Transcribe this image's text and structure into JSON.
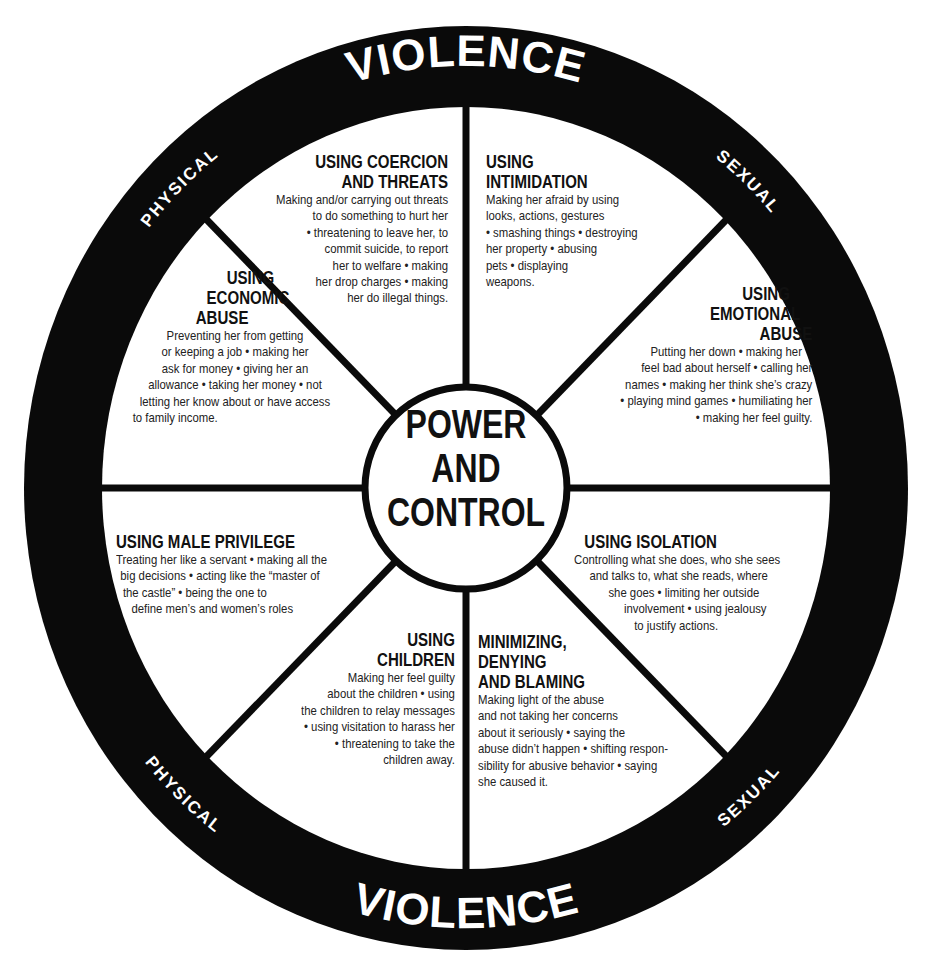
{
  "diagram": {
    "center": {
      "lines": [
        "POWER",
        "AND",
        "CONTROL"
      ]
    },
    "outer_ring": {
      "top": {
        "left": "PHYSICAL",
        "main": "VIOLENCE",
        "right": "SEXUAL"
      },
      "bottom": {
        "left": "PHYSICAL",
        "main": "VIOLENCE",
        "right": "SEXUAL"
      }
    },
    "colors": {
      "ring": "#0a0a0a",
      "background": "#ffffff",
      "text": "#1a1a1a",
      "ring_text": "#ffffff"
    },
    "sections": {
      "coercion": {
        "title": [
          "USING COERCION",
          "AND THREATS"
        ],
        "body": [
          "Making and/or carrying out threats",
          "to do something to hurt her",
          "• threatening to leave her, to",
          "commit suicide, to report",
          "her to welfare • making",
          "her drop charges • making",
          "her do illegal things."
        ]
      },
      "intimidation": {
        "title": [
          "USING",
          "INTIMIDATION"
        ],
        "body": [
          "Making her afraid by using",
          "looks, actions, gestures",
          "• smashing things • destroying",
          "her property • abusing",
          "pets • displaying",
          "weapons."
        ]
      },
      "economic": {
        "title": [
          "USING",
          "ECONOMIC",
          "ABUSE"
        ],
        "body": [
          "Preventing her from getting",
          "or keeping a job • making her",
          "ask for money • giving her an",
          "allowance • taking her money • not",
          "letting her know about or have access",
          "to family income."
        ]
      },
      "emotional": {
        "title": [
          "USING",
          "EMOTIONAL",
          "ABUSE"
        ],
        "body": [
          "Putting her down • making her",
          "feel bad about herself • calling her",
          "names • making her think she’s crazy",
          "• playing mind games • humiliating her",
          "• making her feel guilty."
        ]
      },
      "male_privilege": {
        "title": [
          "USING MALE PRIVILEGE"
        ],
        "body": [
          "Treating her like a servant • making all the",
          "big decisions • acting like the “master of",
          "the castle”  • being the one to",
          "define men’s and women’s roles"
        ]
      },
      "isolation": {
        "title": [
          "USING ISOLATION"
        ],
        "body": [
          "Controlling what she does, who she sees",
          "and talks to, what she reads, where",
          "she goes • limiting her outside",
          "involvement • using jealousy",
          "to justify actions."
        ]
      },
      "children": {
        "title": [
          "USING",
          "CHILDREN"
        ],
        "body": [
          "Making her feel guilty",
          "about the children • using",
          "the children to relay messages",
          "• using visitation to harass her",
          "• threatening to take the",
          "children away."
        ]
      },
      "minimizing": {
        "title": [
          "MINIMIZING,",
          "DENYING",
          "AND BLAMING"
        ],
        "body": [
          "Making light of the abuse",
          "and not taking her concerns",
          "about it seriously • saying the",
          "abuse didn’t happen • shifting respon-",
          "sibility for abusive behavior • saying",
          "she caused it."
        ]
      }
    }
  }
}
